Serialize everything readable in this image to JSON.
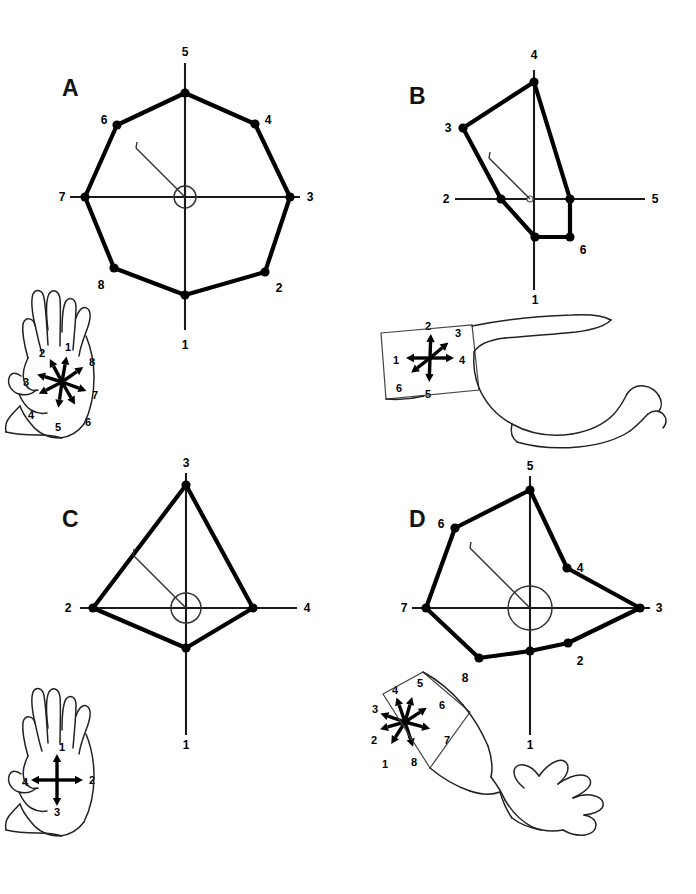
{
  "figure": {
    "background": "#ffffff",
    "ink": "#000000",
    "width": 696,
    "height": 894
  },
  "chart_data": [
    {
      "type": "line",
      "panel": "A",
      "title": "A",
      "subtype": "polar-radial-octagon",
      "xlabel": "",
      "ylabel": "",
      "grid": false,
      "legend": null,
      "n_directions": 8,
      "axis_count": 4,
      "center": [
        185,
        197
      ],
      "center_marker": "circle",
      "center_radius": 11,
      "axis_labels": [
        "1",
        "3",
        "5",
        "7"
      ],
      "categories": [
        "1",
        "2",
        "3",
        "4",
        "5",
        "6",
        "7",
        "8"
      ],
      "angles_deg": [
        270,
        315,
        0,
        45,
        90,
        135,
        180,
        225
      ],
      "values": [
        98,
        92,
        105,
        88,
        104,
        86,
        100,
        90
      ],
      "vertices": [
        {
          "label": "1",
          "x": 185,
          "y": 295,
          "label_x": 185,
          "label_y": 345,
          "on_axis": true
        },
        {
          "label": "2",
          "x": 265,
          "y": 272,
          "label_x": 279,
          "label_y": 288,
          "on_axis": false
        },
        {
          "label": "3",
          "x": 290,
          "y": 197,
          "label_x": 310,
          "label_y": 197,
          "on_axis": true
        },
        {
          "label": "4",
          "x": 255,
          "y": 124,
          "label_x": 268,
          "label_y": 120,
          "on_axis": false
        },
        {
          "label": "5",
          "x": 185,
          "y": 93,
          "label_x": 185,
          "label_y": 52,
          "on_axis": true
        },
        {
          "label": "6",
          "x": 117,
          "y": 125,
          "label_x": 104,
          "label_y": 120,
          "on_axis": false
        },
        {
          "label": "7",
          "x": 85,
          "y": 197,
          "label_x": 62,
          "label_y": 197,
          "on_axis": true
        },
        {
          "label": "8",
          "x": 114,
          "y": 268,
          "label_x": 101,
          "label_y": 285,
          "on_axis": false
        }
      ],
      "axes": [
        {
          "x1": 185,
          "y1": 63,
          "x2": 185,
          "y2": 330
        },
        {
          "x1": 70,
          "y1": 197,
          "x2": 300,
          "y2": 197
        }
      ]
    },
    {
      "type": "line",
      "panel": "B",
      "title": "B",
      "subtype": "polar-radial-hexagon",
      "xlabel": "",
      "ylabel": "",
      "grid": false,
      "legend": null,
      "n_directions": 6,
      "axis_count": 4,
      "center": [
        530,
        199
      ],
      "center_marker": "open-dot",
      "center_radius": 3,
      "axis_labels": [
        "1",
        "2",
        "4",
        "5"
      ],
      "categories": [
        "1",
        "2",
        "3",
        "4",
        "5",
        "6"
      ],
      "angles_deg": [
        270,
        180,
        125,
        90,
        0,
        310
      ],
      "values": [
        38,
        29,
        92,
        90,
        40,
        54
      ],
      "vertices": [
        {
          "label": "1",
          "x": 535,
          "y": 237,
          "label_x": 535,
          "label_y": 300,
          "on_axis": true
        },
        {
          "label": "2",
          "x": 501,
          "y": 199,
          "label_x": 446,
          "label_y": 199,
          "on_axis": true
        },
        {
          "label": "3",
          "x": 463,
          "y": 128,
          "label_x": 448,
          "label_y": 128,
          "on_axis": false
        },
        {
          "label": "4",
          "x": 534,
          "y": 82,
          "label_x": 534,
          "label_y": 55,
          "on_axis": true
        },
        {
          "label": "5",
          "x": 570,
          "y": 199,
          "label_x": 655,
          "label_y": 199,
          "on_axis": true
        },
        {
          "label": "6",
          "x": 570,
          "y": 237,
          "label_x": 583,
          "label_y": 250,
          "on_axis": false
        }
      ],
      "axes": [
        {
          "x1": 534,
          "y1": 70,
          "x2": 534,
          "y2": 290
        },
        {
          "x1": 455,
          "y1": 199,
          "x2": 645,
          "y2": 199
        }
      ]
    },
    {
      "type": "line",
      "panel": "C",
      "title": "C",
      "subtype": "polar-radial-quadrilateral",
      "xlabel": "",
      "ylabel": "",
      "grid": false,
      "legend": null,
      "n_directions": 4,
      "axis_count": 4,
      "center": [
        186,
        608
      ],
      "center_marker": "circle",
      "center_radius": 15,
      "axis_labels": [
        "1",
        "2",
        "3",
        "4"
      ],
      "categories": [
        "1",
        "2",
        "3",
        "4"
      ],
      "angles_deg": [
        270,
        180,
        90,
        0
      ],
      "values": [
        40,
        93,
        133,
        90
      ],
      "vertices": [
        {
          "label": "1",
          "x": 186,
          "y": 648,
          "label_x": 186,
          "label_y": 745,
          "on_axis": true
        },
        {
          "label": "2",
          "x": 93,
          "y": 608,
          "label_x": 68,
          "label_y": 608,
          "on_axis": true
        },
        {
          "label": "3",
          "x": 186,
          "y": 485,
          "label_x": 186,
          "label_y": 463,
          "on_axis": true
        },
        {
          "label": "4",
          "x": 253,
          "y": 608,
          "label_x": 307,
          "label_y": 608,
          "on_axis": true
        }
      ],
      "axes": [
        {
          "x1": 186,
          "y1": 473,
          "x2": 186,
          "y2": 735
        },
        {
          "x1": 80,
          "y1": 608,
          "x2": 297,
          "y2": 608
        }
      ]
    },
    {
      "type": "line",
      "panel": "D",
      "title": "D",
      "subtype": "polar-radial-octagon",
      "xlabel": "",
      "ylabel": "",
      "grid": false,
      "legend": null,
      "n_directions": 8,
      "axis_count": 4,
      "center": [
        530,
        608
      ],
      "center_marker": "circle",
      "center_radius": 22,
      "axis_labels": [
        "1",
        "3",
        "5",
        "7"
      ],
      "categories": [
        "1",
        "2",
        "3",
        "4",
        "5",
        "6",
        "7",
        "8"
      ],
      "angles_deg": [
        270,
        315,
        0,
        45,
        90,
        135,
        180,
        225
      ],
      "values": [
        43,
        54,
        110,
        70,
        120,
        100,
        107,
        72
      ],
      "vertices": [
        {
          "label": "1",
          "x": 530,
          "y": 651,
          "label_x": 530,
          "label_y": 745,
          "on_axis": true
        },
        {
          "label": "2",
          "x": 568,
          "y": 643,
          "label_x": 580,
          "label_y": 661,
          "on_axis": false
        },
        {
          "label": "3",
          "x": 640,
          "y": 608,
          "label_x": 659,
          "label_y": 608,
          "on_axis": true
        },
        {
          "label": "4",
          "x": 567,
          "y": 568,
          "label_x": 580,
          "label_y": 568,
          "on_axis": false
        },
        {
          "label": "5",
          "x": 530,
          "y": 490,
          "label_x": 530,
          "label_y": 466,
          "on_axis": true
        },
        {
          "label": "6",
          "x": 455,
          "y": 528,
          "label_x": 441,
          "label_y": 524,
          "on_axis": false
        },
        {
          "label": "7",
          "x": 426,
          "y": 608,
          "label_x": 404,
          "label_y": 608,
          "on_axis": true
        },
        {
          "label": "8",
          "x": 479,
          "y": 658,
          "label_x": 465,
          "label_y": 678,
          "on_axis": false
        }
      ],
      "axes": [
        {
          "x1": 530,
          "y1": 476,
          "x2": 530,
          "y2": 735
        },
        {
          "x1": 412,
          "y1": 608,
          "x2": 650,
          "y2": 608
        }
      ]
    }
  ],
  "anatomy_insets": [
    {
      "panel": "A",
      "name": "hand-dorsum-8-direction-inset",
      "body_part": "hand",
      "view": "dorsal",
      "n_arrows": 8,
      "center": [
        62,
        382
      ],
      "arrow_length": 26,
      "arrows": [
        {
          "label": "1",
          "angle_deg": 80,
          "label_x": 68,
          "label_y": 347
        },
        {
          "label": "2",
          "angle_deg": 118,
          "label_x": 42,
          "label_y": 353
        },
        {
          "label": "3",
          "angle_deg": 163,
          "label_x": 26,
          "label_y": 382
        },
        {
          "label": "4",
          "angle_deg": 207,
          "label_x": 31,
          "label_y": 415
        },
        {
          "label": "5",
          "angle_deg": 262,
          "label_x": 58,
          "label_y": 427
        },
        {
          "label": "6",
          "angle_deg": 300,
          "label_x": 88,
          "label_y": 422
        },
        {
          "label": "7",
          "angle_deg": 340,
          "label_x": 95,
          "label_y": 395
        },
        {
          "label": "8",
          "angle_deg": 35,
          "label_x": 92,
          "label_y": 362
        }
      ]
    },
    {
      "panel": "B",
      "name": "forearm-skin-patch-6-direction-inset",
      "body_part": "arm",
      "view": "lateral",
      "n_arrows": 6,
      "center": [
        430,
        358
      ],
      "arrow_length": 24,
      "arrows": [
        {
          "label": "1",
          "angle_deg": 180,
          "label_x": 396,
          "label_y": 360
        },
        {
          "label": "2",
          "angle_deg": 88,
          "label_x": 428,
          "label_y": 326
        },
        {
          "label": "3",
          "angle_deg": 40,
          "label_x": 458,
          "label_y": 333
        },
        {
          "label": "4",
          "angle_deg": 0,
          "label_x": 462,
          "label_y": 360
        },
        {
          "label": "5",
          "angle_deg": 268,
          "label_x": 428,
          "label_y": 394
        },
        {
          "label": "6",
          "angle_deg": 218,
          "label_x": 399,
          "label_y": 388
        }
      ]
    },
    {
      "panel": "C",
      "name": "hand-dorsum-4-direction-inset",
      "body_part": "hand",
      "view": "dorsal",
      "n_arrows": 4,
      "center": [
        57,
        780
      ],
      "arrow_length": 26,
      "arrows": [
        {
          "label": "1",
          "angle_deg": 90,
          "label_x": 62,
          "label_y": 747
        },
        {
          "label": "2",
          "angle_deg": 0,
          "label_x": 92,
          "label_y": 780
        },
        {
          "label": "3",
          "angle_deg": 270,
          "label_x": 57,
          "label_y": 812
        },
        {
          "label": "4",
          "angle_deg": 180,
          "label_x": 25,
          "label_y": 782
        }
      ]
    },
    {
      "panel": "D",
      "name": "forearm-skin-patch-8-direction-inset",
      "body_part": "arm",
      "view": "dorsal",
      "n_arrows": 8,
      "center": [
        405,
        722
      ],
      "arrow_length": 26,
      "arrows": [
        {
          "label": "1",
          "angle_deg": 238,
          "label_x": 385,
          "label_y": 764
        },
        {
          "label": "2",
          "angle_deg": 196,
          "label_x": 374,
          "label_y": 740
        },
        {
          "label": "3",
          "angle_deg": 161,
          "label_x": 375,
          "label_y": 709
        },
        {
          "label": "4",
          "angle_deg": 109,
          "label_x": 395,
          "label_y": 690
        },
        {
          "label": "5",
          "angle_deg": 74,
          "label_x": 420,
          "label_y": 683
        },
        {
          "label": "6",
          "angle_deg": 33,
          "label_x": 442,
          "label_y": 705
        },
        {
          "label": "7",
          "angle_deg": 345,
          "label_x": 447,
          "label_y": 740
        },
        {
          "label": "8",
          "angle_deg": 288,
          "label_x": 414,
          "label_y": 762
        }
      ]
    }
  ]
}
